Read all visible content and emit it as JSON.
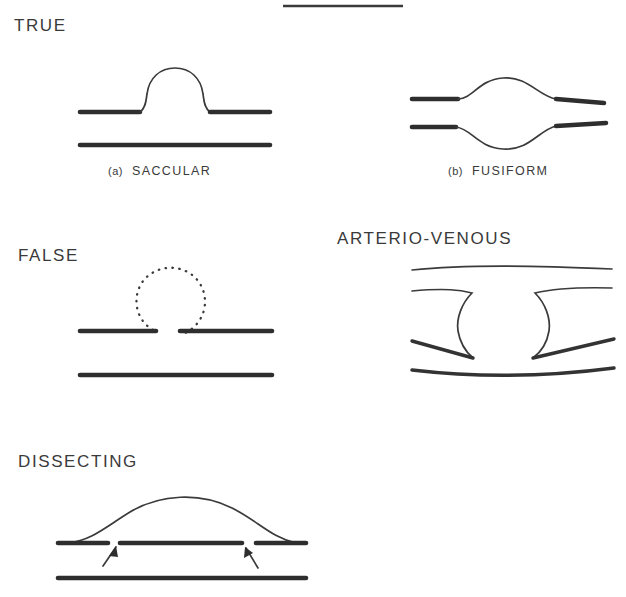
{
  "figure": {
    "title_rule_present": true,
    "ink_color": "#2e2e2e",
    "background_color": "#ffffff",
    "panels": [
      {
        "id": "true-saccular",
        "heading": "TRUE",
        "caption_index": "(a)",
        "caption_text": "SACCULAR"
      },
      {
        "id": "true-fusiform",
        "heading": "",
        "caption_index": "(b)",
        "caption_text": "FUSIFORM"
      },
      {
        "id": "false",
        "heading": "FALSE",
        "caption_index": "",
        "caption_text": ""
      },
      {
        "id": "arterio-venous",
        "heading": "ARTERIO-VENOUS",
        "caption_index": "",
        "caption_text": ""
      },
      {
        "id": "dissecting",
        "heading": "DISSECTING",
        "caption_index": "",
        "caption_text": ""
      }
    ]
  },
  "headings": {
    "true": "TRUE",
    "false": "FALSE",
    "arterio_venous": "ARTERIO-VENOUS",
    "dissecting": "DISSECTING"
  },
  "captions": {
    "saccular_index": "(a)",
    "saccular_text": "SACCULAR",
    "fusiform_index": "(b)",
    "fusiform_text": "FUSIFORM"
  }
}
